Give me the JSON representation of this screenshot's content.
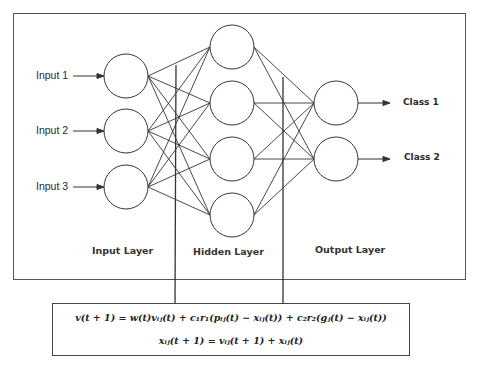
{
  "diagram": {
    "inputs": [
      {
        "label": "Input 1"
      },
      {
        "label": "Input 2"
      },
      {
        "label": "Input 3"
      }
    ],
    "hidden_count": 4,
    "outputs": [
      {
        "label": "Class 1"
      },
      {
        "label": "Class 2"
      }
    ],
    "layer_labels": {
      "input": "Input Layer",
      "hidden": "Hidden Layer",
      "output": "Output Layer"
    },
    "formula": {
      "line1": "v(t + 1) = w(t)vᵢⱼ(t) + c₁r₁(pᵢⱼ(t) − xᵢⱼ(t)) + c₂r₂(gⱼ(t) − xᵢⱼ(t))",
      "line2": "xᵢⱼ(t + 1) = vᵢⱼ(t + 1) + xᵢⱼ(t)"
    },
    "colors": {
      "stroke": "#333333",
      "background": "#ffffff"
    }
  }
}
